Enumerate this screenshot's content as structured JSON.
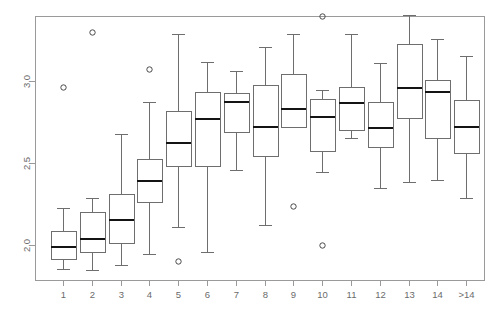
{
  "chart_data": {
    "type": "box",
    "title": "",
    "xlabel": "",
    "ylabel": "",
    "grid": false,
    "legend": null,
    "ylim": [
      1.83,
      3.42
    ],
    "ytick_values": [
      2.0,
      2.5,
      3.0
    ],
    "ytick_labels": [
      "2.0",
      "2.5",
      "3.0"
    ],
    "categories": [
      "1",
      "2",
      "3",
      "4",
      "5",
      "6",
      "7",
      "8",
      "9",
      "10",
      "11",
      "12",
      "13",
      "14",
      ">14"
    ],
    "boxes": [
      {
        "category": "1",
        "whisker_low": 1.855,
        "q1": 1.915,
        "median": 1.99,
        "q3": 2.085,
        "whisker_high": 2.225,
        "outliers": [
          2.965
        ]
      },
      {
        "category": "2",
        "whisker_low": 1.85,
        "q1": 1.96,
        "median": 2.035,
        "q3": 2.2,
        "whisker_high": 2.285,
        "outliers": [
          3.3
        ]
      },
      {
        "category": "3",
        "whisker_low": 1.88,
        "q1": 2.015,
        "median": 2.155,
        "q3": 2.31,
        "whisker_high": 2.675,
        "outliers": []
      },
      {
        "category": "4",
        "whisker_low": 1.945,
        "q1": 2.265,
        "median": 2.39,
        "q3": 2.525,
        "whisker_high": 2.875,
        "outliers": [
          3.075
        ]
      },
      {
        "category": "5",
        "whisker_low": 2.11,
        "q1": 2.48,
        "median": 2.625,
        "q3": 2.815,
        "whisker_high": 3.285,
        "outliers": [
          1.9
        ]
      },
      {
        "category": "6",
        "whisker_low": 1.96,
        "q1": 2.48,
        "median": 2.77,
        "q3": 2.93,
        "whisker_high": 3.115,
        "outliers": []
      },
      {
        "category": "7",
        "whisker_low": 2.455,
        "q1": 2.69,
        "median": 2.875,
        "q3": 2.925,
        "whisker_high": 3.06,
        "outliers": []
      },
      {
        "category": "8",
        "whisker_low": 2.12,
        "q1": 2.545,
        "median": 2.72,
        "q3": 2.975,
        "whisker_high": 3.205,
        "outliers": []
      },
      {
        "category": "9",
        "whisker_low": 2.72,
        "q1": 2.72,
        "median": 2.83,
        "q3": 3.045,
        "whisker_high": 3.285,
        "outliers": [
          2.24
        ]
      },
      {
        "category": "10",
        "whisker_low": 2.445,
        "q1": 2.575,
        "median": 2.78,
        "q3": 2.89,
        "whisker_high": 2.945,
        "outliers": [
          3.395,
          2.0
        ]
      },
      {
        "category": "11",
        "whisker_low": 2.65,
        "q1": 2.7,
        "median": 2.865,
        "q3": 2.965,
        "whisker_high": 3.285,
        "outliers": []
      },
      {
        "category": "12",
        "whisker_low": 2.345,
        "q1": 2.6,
        "median": 2.715,
        "q3": 2.87,
        "whisker_high": 3.11,
        "outliers": []
      },
      {
        "category": "13",
        "whisker_low": 2.385,
        "q1": 2.775,
        "median": 2.955,
        "q3": 3.225,
        "whisker_high": 3.4,
        "outliers": []
      },
      {
        "category": "14",
        "whisker_low": 2.395,
        "q1": 2.65,
        "median": 2.935,
        "q3": 3.005,
        "whisker_high": 3.255,
        "outliers": []
      },
      {
        "category": ">14",
        "whisker_low": 2.285,
        "q1": 2.56,
        "median": 2.72,
        "q3": 2.885,
        "whisker_high": 3.15,
        "outliers": []
      }
    ]
  },
  "geometry": {
    "plot_left": 35,
    "plot_right": 484,
    "plot_top": 16,
    "plot_bottom": 280,
    "y_at_2_0": 245,
    "y_at_3_0": 81,
    "first_center": 63,
    "center_step": 28.8,
    "box_half_width": 12.5,
    "cap_half_width": 6.5,
    "outlier_radius": 2.7
  },
  "colors": {
    "frame": "#9a9a9a",
    "box_stroke": "#6e6e6e",
    "median": "#141414",
    "outlier": "#4a4a4a",
    "tick_text": "#6b6b6b",
    "background": "#ffffff"
  }
}
